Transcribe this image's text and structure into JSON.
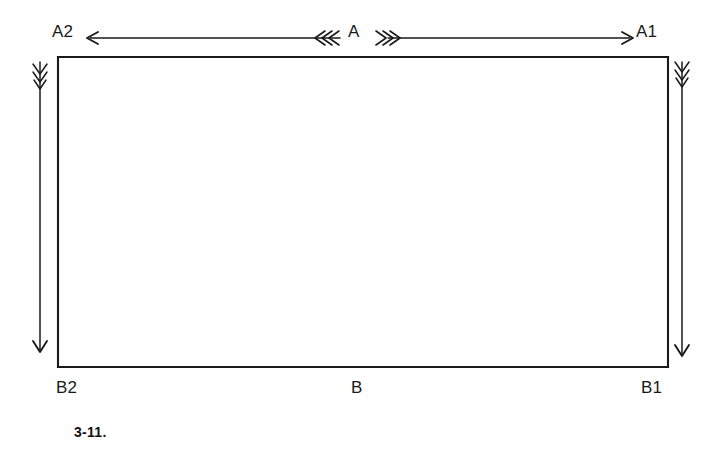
{
  "figure": {
    "caption": "3-11.",
    "stroke_color": "#1a1a1a",
    "background_color": "#ffffff",
    "labels": {
      "top_left": "A2",
      "top_right": "A1",
      "top_center": "A",
      "bottom_left": "B2",
      "bottom_right": "B1",
      "bottom_center": "B"
    },
    "geometry": {
      "rect_left": 58,
      "rect_top": 57,
      "rect_right": 668,
      "rect_bottom": 367,
      "rect_width": 610,
      "rect_height": 310
    },
    "annotations": {
      "horizontal_dimension": {
        "label": "A",
        "axis": "horizontal",
        "y": 38,
        "x_start": 88,
        "x_end": 632,
        "left_arrowhead": "arrow-left",
        "right_arrowhead": "arrow-right",
        "center_marks": "triple-chevron-feather-both-directions"
      },
      "left_dimension": {
        "label": "B2",
        "axis": "vertical",
        "x": 40,
        "y_start": 62,
        "y_end": 352,
        "top_marks": "feathered-barbs",
        "bottom_arrowhead": "arrow-down"
      },
      "right_dimension": {
        "label": "B1",
        "axis": "vertical",
        "x": 682,
        "y_start": 62,
        "y_end": 356,
        "top_marks": "feathered-barbs",
        "bottom_arrowhead": "arrow-down"
      }
    }
  }
}
